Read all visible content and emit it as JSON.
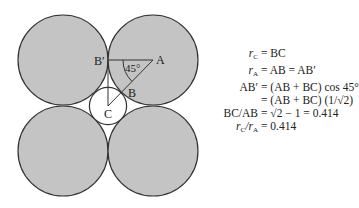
{
  "diagram": {
    "title": "",
    "fill_color": "#c4c4c4",
    "stroke_color": "#333333",
    "large_circles": [
      {
        "cx": 63,
        "cy": 60,
        "r": 45
      },
      {
        "cx": 153,
        "cy": 60,
        "r": 45
      },
      {
        "cx": 63,
        "cy": 151,
        "r": 45
      },
      {
        "cx": 153,
        "cy": 151,
        "r": 45
      }
    ],
    "small_circle": {
      "cx": 108,
      "cy": 106,
      "r": 19
    },
    "labels": {
      "A": "A",
      "B": "B",
      "B_prime": "B′",
      "C": "C",
      "angle": "45°"
    }
  },
  "equations": [
    {
      "lhs_main": "r",
      "lhs_sub": "C",
      "lhs_rest": "",
      "rhs": "= BC"
    },
    {
      "lhs_main": "r",
      "lhs_sub": "A",
      "lhs_rest": "",
      "rhs": "= AB = AB′"
    },
    {
      "lhs_main": "",
      "lhs_sub": "",
      "lhs_rest": "AB′",
      "rhs": "= (AB + BC) cos 45°"
    },
    {
      "lhs_main": "",
      "lhs_sub": "",
      "lhs_rest": "",
      "rhs": "= (AB + BC) (1/√2)"
    },
    {
      "lhs_main": "",
      "lhs_sub": "",
      "lhs_rest": "BC/AB",
      "rhs": "= √2 − 1 = 0.414"
    },
    {
      "lhs_main": "r",
      "lhs_sub": "C",
      "lhs_rest": "/r",
      "lhs_sub2": "A",
      "rhs": "= 0.414"
    }
  ]
}
